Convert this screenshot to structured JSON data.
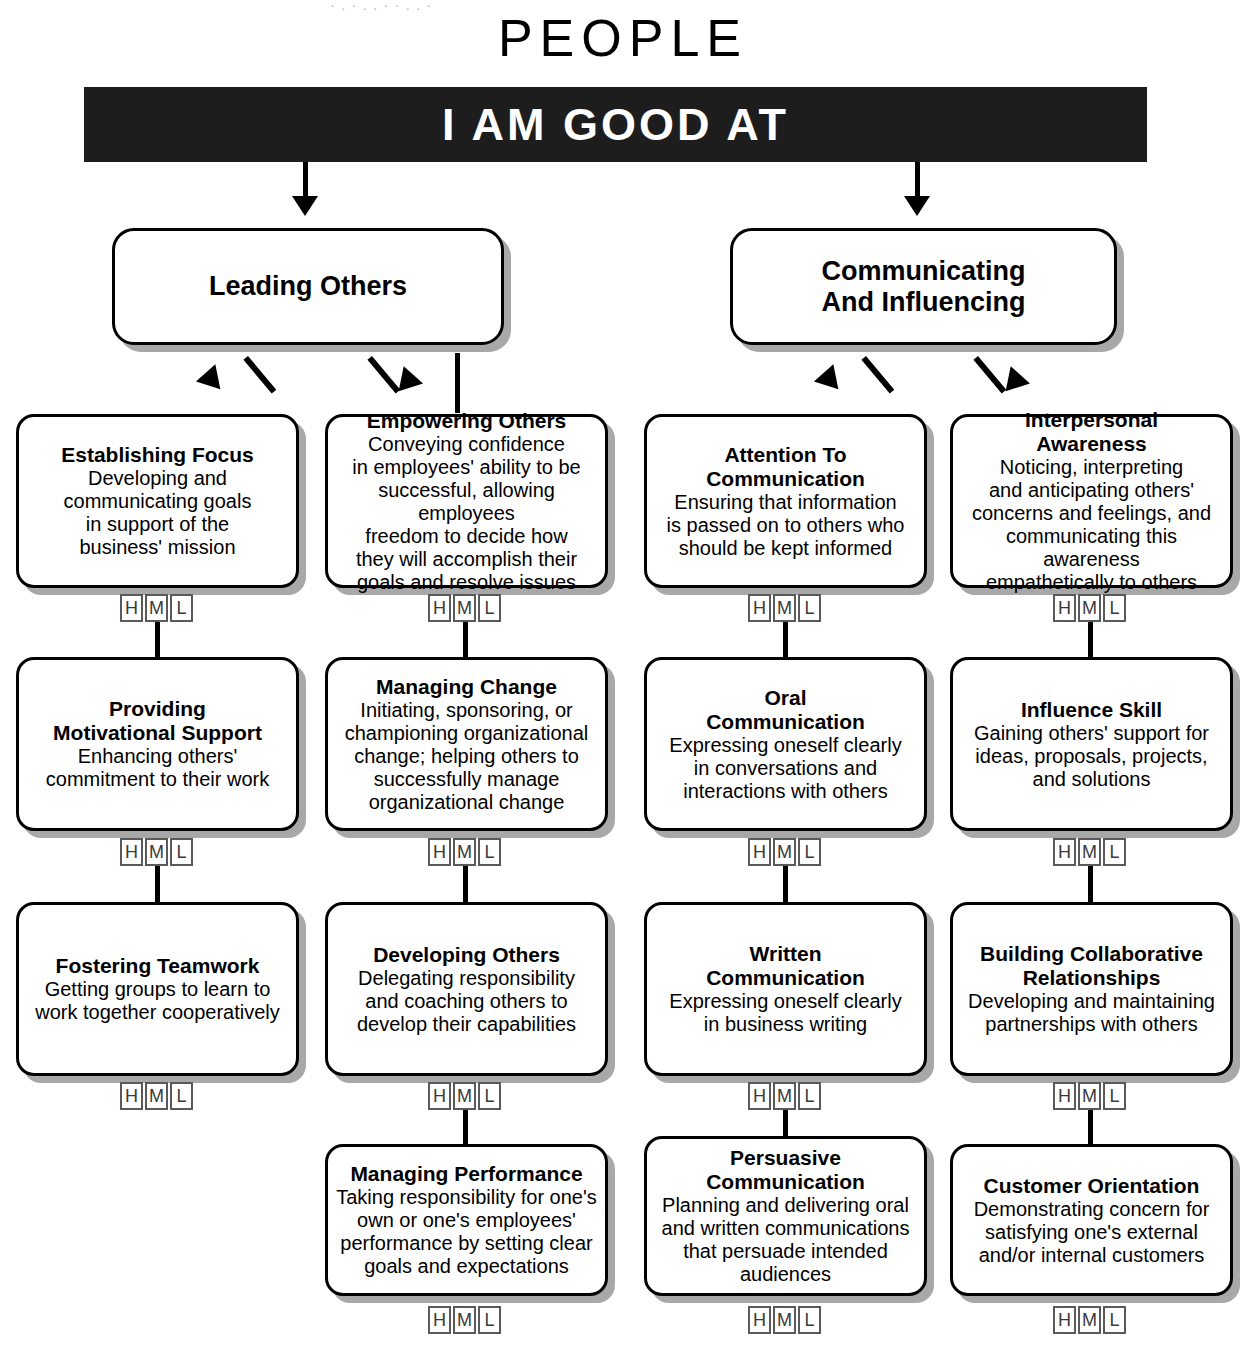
{
  "header": {
    "top_sliver_text": "· . · , . · · , . ·",
    "page_title": "PEOPLE",
    "banner_label": "I AM GOOD AT"
  },
  "rating": {
    "levels": [
      "H",
      "M",
      "L"
    ]
  },
  "branches": [
    {
      "id": "leading-others",
      "label": "Leading Others"
    },
    {
      "id": "communicating-and-influencing",
      "label": "Communicating\nAnd Influencing"
    }
  ],
  "columns": [
    {
      "id": "column-1",
      "branch": "leading-others",
      "nodes": [
        {
          "id": "establishing-focus",
          "title": "Establishing Focus",
          "desc": "Developing and\ncommunicating goals\nin support of the\nbusiness' mission"
        },
        {
          "id": "providing-motivational-support",
          "title": "Providing\nMotivational Support",
          "desc": "Enhancing others'\ncommitment to their work"
        },
        {
          "id": "fostering-teamwork",
          "title": "Fostering Teamwork",
          "desc": "Getting groups to learn to\nwork together cooperatively"
        }
      ]
    },
    {
      "id": "column-2",
      "branch": "leading-others",
      "nodes": [
        {
          "id": "empowering-others",
          "title": "Empowering Others",
          "desc": "Conveying confidence\nin employees' ability to be\nsuccessful, allowing employees\nfreedom to decide how\nthey will accomplish their\ngoals and resolve issues"
        },
        {
          "id": "managing-change",
          "title": "Managing Change",
          "desc": "Initiating, sponsoring, or\nchampioning organizational\nchange; helping others to\nsuccessfully manage\norganizational change"
        },
        {
          "id": "developing-others",
          "title": "Developing Others",
          "desc": "Delegating responsibility\nand coaching others to\ndevelop their capabilities"
        },
        {
          "id": "managing-performance",
          "title": "Managing Performance",
          "desc": "Taking responsibility for one's\nown or one's employees'\nperformance by setting clear\ngoals and expectations"
        }
      ]
    },
    {
      "id": "column-3",
      "branch": "communicating-and-influencing",
      "nodes": [
        {
          "id": "attention-to-communication",
          "title": "Attention To\nCommunication",
          "desc": "Ensuring that information\nis passed on to others who\nshould be kept informed"
        },
        {
          "id": "oral-communication",
          "title": "Oral\nCommunication",
          "desc": "Expressing oneself clearly\nin conversations and\ninteractions with others"
        },
        {
          "id": "written-communication",
          "title": "Written\nCommunication",
          "desc": "Expressing oneself clearly\nin business writing"
        },
        {
          "id": "persuasive-communication",
          "title": "Persuasive\nCommunication",
          "desc": "Planning and delivering oral\nand written communications\nthat persuade intended\naudiences"
        }
      ]
    },
    {
      "id": "column-4",
      "branch": "communicating-and-influencing",
      "nodes": [
        {
          "id": "interpersonal-awareness",
          "title": "Interpersonal\nAwareness",
          "desc": "Noticing, interpreting\nand anticipating others'\nconcerns and feelings, and\ncommunicating this awareness\nempathetically to others"
        },
        {
          "id": "influence-skill",
          "title": "Influence Skill",
          "desc": "Gaining others' support for\nideas, proposals, projects,\nand solutions"
        },
        {
          "id": "building-collaborative-relationships",
          "title": "Building Collaborative\nRelationships",
          "desc": "Developing and maintaining\npartnerships with others"
        },
        {
          "id": "customer-orientation",
          "title": "Customer Orientation",
          "desc": "Demonstrating concern for\nsatisfying one's external\nand/or internal customers"
        }
      ]
    }
  ],
  "colors": {
    "banner_background": "#1d1d1d",
    "banner_text": "#ffffff",
    "box_border": "#000000",
    "box_shadow": "#a8a8a8",
    "rating_border": "#5a5a5a",
    "page_background": "#ffffff"
  }
}
